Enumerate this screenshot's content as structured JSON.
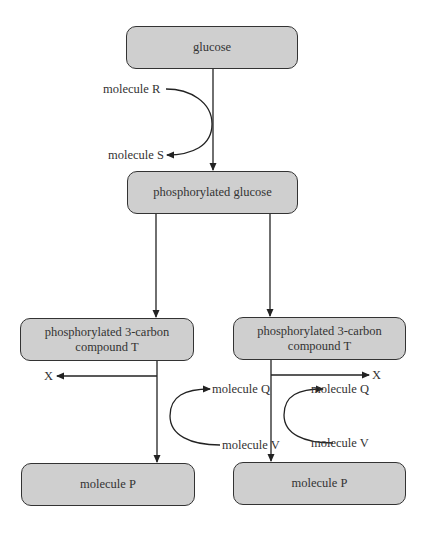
{
  "diagram": {
    "nodes": {
      "glucose": "glucose",
      "phosphorylated_glucose": "phosphorylated glucose",
      "compound_t_left_line1": "phosphorylated 3-carbon",
      "compound_t_left_line2": "compound T",
      "compound_t_right_line1": "phosphorylated 3-carbon",
      "compound_t_right_line2": "compound T",
      "molecule_p_left": "molecule P",
      "molecule_p_right": "molecule P"
    },
    "labels": {
      "molecule_r": "molecule R",
      "molecule_s": "molecule S",
      "x_left": "X",
      "x_right": "X",
      "molecule_q_left": "molecule Q",
      "molecule_v_left": "molecule V",
      "molecule_q_right": "molecule Q",
      "molecule_v_right": "molecule V"
    },
    "edges": [
      {
        "from": "glucose",
        "to": "phosphorylated glucose",
        "input": "molecule R",
        "output": "molecule S"
      },
      {
        "from": "phosphorylated glucose",
        "to": "phosphorylated 3-carbon compound T (left)"
      },
      {
        "from": "phosphorylated glucose",
        "to": "phosphorylated 3-carbon compound T (right)"
      },
      {
        "from": "phosphorylated 3-carbon compound T (left)",
        "to": "molecule P (left)",
        "outputs": [
          "X",
          "molecule Q"
        ],
        "input": "molecule V"
      },
      {
        "from": "phosphorylated 3-carbon compound T (right)",
        "to": "molecule P (right)",
        "outputs": [
          "X",
          "molecule Q"
        ],
        "input": "molecule V"
      }
    ]
  }
}
